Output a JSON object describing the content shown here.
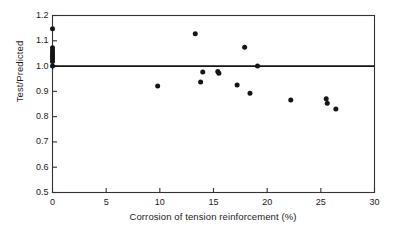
{
  "chart_data": {
    "type": "scatter",
    "title": "",
    "xlabel": "Corrosion of tension reinforcement (%)",
    "ylabel": "Test/Predicted",
    "xlim": [
      0,
      30
    ],
    "ylim": [
      0.5,
      1.2
    ],
    "xticks": [
      "0",
      "5",
      "10",
      "15",
      "20",
      "25",
      "30"
    ],
    "xtick_values": [
      0,
      5,
      10,
      15,
      20,
      25,
      30
    ],
    "yticks": [
      "0.5",
      "0.6",
      "0.7",
      "0.8",
      "0.9",
      "1.0",
      "1.1",
      "1.2"
    ],
    "ytick_values": [
      0.5,
      0.6,
      0.7,
      0.8,
      0.9,
      1.0,
      1.1,
      1.2
    ],
    "grid": false,
    "legend": false,
    "marker": "filled-circle",
    "marker_color": "#151515",
    "reference_lines": [
      {
        "name": "unity-line",
        "axis": "y",
        "value": 1.0,
        "color": "#151515",
        "width": 1.8
      }
    ],
    "series": [
      {
        "name": "Test/Predicted ratio",
        "points": [
          [
            0.0,
            1.148
          ],
          [
            0.0,
            1.072
          ],
          [
            0.0,
            1.062
          ],
          [
            0.0,
            1.052
          ],
          [
            0.0,
            1.044
          ],
          [
            0.0,
            1.036
          ],
          [
            0.0,
            1.028
          ],
          [
            0.0,
            1.018
          ],
          [
            0.0,
            1.0
          ],
          [
            9.8,
            0.921
          ],
          [
            13.3,
            1.128
          ],
          [
            13.8,
            0.937
          ],
          [
            14.0,
            0.977
          ],
          [
            15.4,
            0.979
          ],
          [
            15.5,
            0.972
          ],
          [
            17.2,
            0.925
          ],
          [
            17.9,
            1.074
          ],
          [
            18.4,
            0.893
          ],
          [
            19.1,
            1.0
          ],
          [
            22.2,
            0.866
          ],
          [
            25.5,
            0.871
          ],
          [
            25.6,
            0.853
          ],
          [
            26.4,
            0.83
          ]
        ]
      }
    ]
  },
  "axis_title_x": "Corrosion of tension reinforcement (%)",
  "axis_title_y": "Test/Predicted"
}
